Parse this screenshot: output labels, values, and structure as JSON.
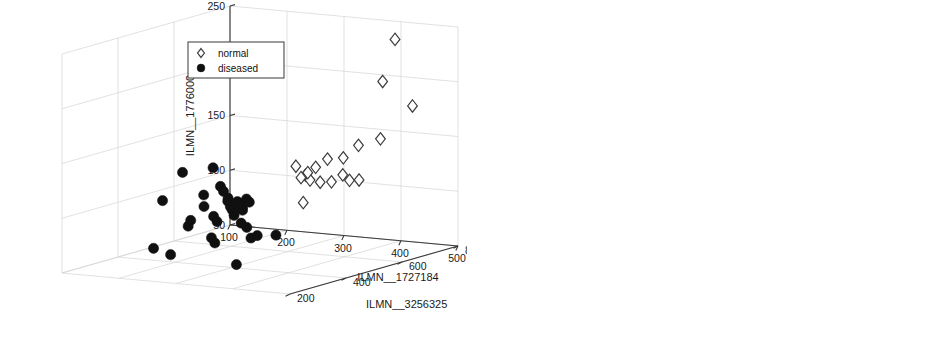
{
  "figure": {
    "type": "multi-panel-3d-scatter",
    "panel_count": 2,
    "background": "#ffffff",
    "marker_colors": {
      "diseased": "#101010",
      "normal": "#ffffff",
      "normal_edge": "#3c3c3c"
    }
  },
  "legend": {
    "entries": [
      {
        "label": "normal",
        "marker": "open-diamond"
      },
      {
        "label": "diseased",
        "marker": "filled-circle"
      }
    ]
  },
  "chart_data": [
    {
      "type": "scatter",
      "panel": "left",
      "title": "",
      "xlabel": "ILMN__1727184",
      "ylabel": "ILMN__3256325",
      "zlabel": "ILMN__1776000",
      "xlim": [
        100,
        500
      ],
      "ylim": [
        200,
        800
      ],
      "zlim": [
        50,
        250
      ],
      "xticks": [
        100,
        200,
        300,
        400,
        500
      ],
      "yticks": [
        200,
        400,
        600,
        800
      ],
      "zticks": [
        50,
        100,
        150,
        200,
        250
      ],
      "xtick_labels": [
        "100",
        "200",
        "300",
        "400",
        "500"
      ],
      "ytick_labels": [
        "200",
        "400",
        "600",
        "800"
      ],
      "ztick_labels": [
        "50",
        "100",
        "150",
        "200",
        "250"
      ],
      "grid": true,
      "legend_position": "top-center",
      "series": [
        {
          "name": "diseased",
          "marker": "filled-circle",
          "points": [
            [
              243,
              268,
              118
            ],
            [
              281,
              262,
              146
            ],
            [
              286,
              281,
              101
            ],
            [
              284,
              276,
              96
            ],
            [
              297,
              305,
              123
            ],
            [
              300,
              300,
              113
            ],
            [
              310,
              312,
              148
            ],
            [
              320,
              318,
              131
            ],
            [
              322,
              325,
              126
            ],
            [
              327,
              330,
              117
            ],
            [
              330,
              333,
              112
            ],
            [
              331,
              337,
              109
            ],
            [
              333,
              340,
              107
            ],
            [
              335,
              336,
              104
            ],
            [
              337,
              344,
              116
            ],
            [
              340,
              348,
              114
            ],
            [
              342,
              352,
              110
            ],
            [
              345,
              341,
              97
            ],
            [
              347,
              356,
              118
            ],
            [
              350,
              360,
              115
            ],
            [
              352,
              347,
              93
            ],
            [
              318,
              290,
              86
            ],
            [
              321,
              296,
              81
            ],
            [
              239,
              244,
              76
            ],
            [
              266,
              250,
              71
            ],
            [
              351,
              364,
              82
            ],
            [
              358,
              372,
              84
            ],
            [
              381,
              392,
              84
            ],
            [
              348,
              318,
              61
            ],
            [
              313,
              308,
              104
            ],
            [
              316,
              314,
              99
            ],
            [
              329,
              327,
              120
            ],
            [
              336,
              338,
              111
            ],
            [
              343,
              350,
              108
            ]
          ]
        },
        {
          "name": "normal",
          "marker": "open-diamond",
          "points": [
            [
              418,
              742,
              239
            ],
            [
              414,
              706,
              203
            ],
            [
              430,
              780,
              176
            ],
            [
              418,
              690,
              152
            ],
            [
              404,
              640,
              149
            ],
            [
              396,
              602,
              140
            ],
            [
              386,
              566,
              141
            ],
            [
              378,
              540,
              135
            ],
            [
              370,
              520,
              129
            ],
            [
              366,
              512,
              127
            ],
            [
              374,
              528,
              124
            ],
            [
              382,
              548,
              121
            ],
            [
              390,
              572,
              120
            ],
            [
              402,
              612,
              119
            ],
            [
              408,
              634,
              118
            ],
            [
              398,
              596,
              125
            ],
            [
              372,
              524,
              131
            ],
            [
              362,
              502,
              138
            ],
            [
              368,
              516,
              104
            ]
          ]
        }
      ]
    },
    {
      "type": "scatter",
      "panel": "right",
      "title": "",
      "xlabel": "cg16895719",
      "ylabel": "cg05656440",
      "zlabel": "cg2644687",
      "xlim": [
        0.7,
        0.2
      ],
      "ylim": [
        0.5,
        0.9
      ],
      "zlim": [
        0,
        0.05
      ],
      "xticks": [
        0.7,
        0.6,
        0.5,
        0.4,
        0.3,
        0.2
      ],
      "yticks": [
        0.5,
        0.6,
        0.7,
        0.8,
        0.9
      ],
      "zticks": [
        0,
        0.01,
        0.02,
        0.03,
        0.04,
        0.05
      ],
      "xtick_labels": [
        "0.7",
        "0.6",
        "0.5",
        "0.4",
        "0.3",
        "0.2"
      ],
      "ytick_labels": [
        "0.5",
        "0.6",
        "0.7",
        "0.8",
        "0.9"
      ],
      "ztick_labels": [
        "0",
        "0.01",
        "0.02",
        "0.03",
        "0.04",
        "0.05"
      ],
      "grid": true,
      "legend_position": "top-center",
      "series": [
        {
          "name": "diseased",
          "marker": "filled-circle",
          "points": [
            [
              0.605,
              0.512,
              0.027
            ],
            [
              0.603,
              0.509,
              0.025
            ],
            [
              0.487,
              0.545,
              0.0253
            ],
            [
              0.412,
              0.585,
              0.0325
            ],
            [
              0.432,
              0.578,
              0.0295
            ],
            [
              0.397,
              0.597,
              0.0278
            ],
            [
              0.428,
              0.565,
              0.0265
            ],
            [
              0.408,
              0.588,
              0.0243
            ],
            [
              0.404,
              0.592,
              0.0237
            ],
            [
              0.437,
              0.572,
              0.0208
            ],
            [
              0.433,
              0.575,
              0.0203
            ],
            [
              0.425,
              0.582,
              0.0198
            ],
            [
              0.396,
              0.601,
              0.0216
            ],
            [
              0.391,
              0.606,
              0.0212
            ],
            [
              0.385,
              0.612,
              0.0193
            ],
            [
              0.379,
              0.618,
              0.0186
            ],
            [
              0.373,
              0.623,
              0.0181
            ],
            [
              0.448,
              0.558,
              0.015
            ],
            [
              0.424,
              0.576,
              0.0146
            ],
            [
              0.42,
              0.58,
              0.0142
            ],
            [
              0.405,
              0.59,
              0.0154
            ],
            [
              0.399,
              0.595,
              0.0149
            ],
            [
              0.393,
              0.6,
              0.0131
            ],
            [
              0.388,
              0.604,
              0.0127
            ],
            [
              0.381,
              0.61,
              0.0137
            ],
            [
              0.402,
              0.593,
              0.0111
            ],
            [
              0.366,
              0.628,
              0.016
            ],
            [
              0.362,
              0.632,
              0.0156
            ],
            [
              0.341,
              0.646,
              0.0098
            ],
            [
              0.338,
              0.65,
              0.0093
            ],
            [
              0.343,
              0.648,
              0.0075
            ],
            [
              0.316,
              0.668,
              0.0187
            ],
            [
              0.258,
              0.712,
              0.0121
            ],
            [
              0.41,
              0.586,
              0.0168
            ]
          ]
        },
        {
          "name": "normal",
          "marker": "open-diamond",
          "points": [
            [
              0.264,
              0.792,
              0.0482
            ],
            [
              0.307,
              0.742,
              0.0452
            ],
            [
              0.248,
              0.806,
              0.0438
            ],
            [
              0.237,
              0.818,
              0.0426
            ],
            [
              0.336,
              0.712,
              0.041
            ],
            [
              0.311,
              0.734,
              0.0395
            ],
            [
              0.326,
              0.722,
              0.0382
            ],
            [
              0.331,
              0.718,
              0.0368
            ],
            [
              0.318,
              0.73,
              0.0356
            ],
            [
              0.324,
              0.726,
              0.0344
            ],
            [
              0.292,
              0.752,
              0.035
            ],
            [
              0.286,
              0.758,
              0.034
            ],
            [
              0.281,
              0.763,
              0.033
            ],
            [
              0.276,
              0.768,
              0.0318
            ],
            [
              0.302,
              0.746,
              0.0305
            ],
            [
              0.297,
              0.75,
              0.0297
            ],
            [
              0.271,
              0.772,
              0.029
            ],
            [
              0.266,
              0.776,
              0.0278
            ],
            [
              0.288,
              0.756,
              0.0265
            ],
            [
              0.283,
              0.76,
              0.025
            ]
          ]
        }
      ]
    }
  ]
}
